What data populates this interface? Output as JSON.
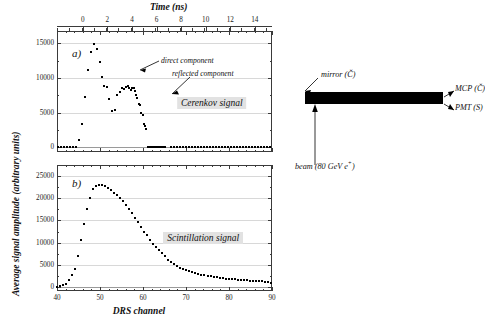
{
  "figure": {
    "y_axis_label": "Average signal amplitude (arbitrary units)",
    "x_axis_label_bottom": "DRS channel",
    "x_axis_label_top": "Time (ns)"
  },
  "panel_a": {
    "letter": "a)",
    "signal_label": "Cerenkov signal",
    "annotation_direct": "direct component",
    "annotation_reflected": "reflected component"
  },
  "panel_b": {
    "letter": "b)",
    "signal_label": "Scintillation signal"
  },
  "schematic": {
    "mirror_label": "mirror (Č)",
    "mcp_label": "MCP (Č)",
    "pmt_label": "PMT (S)",
    "beam_label": "beam (80 GeV e",
    "beam_label_sup": "+",
    "beam_label_end": ")"
  },
  "colors": {
    "axis": "#3a3a3a",
    "grid": "#d8d8d8",
    "marker": "#000000",
    "label_bg": "#e2e2e2",
    "bar": "#000000"
  },
  "chart_data": [
    {
      "type": "scatter",
      "id": "panel-a",
      "title": "Cerenkov signal",
      "xlabel": "DRS channel",
      "xlabel_top": "Time (ns)",
      "ylabel": "Average signal amplitude (arbitrary units)",
      "xlim": [
        40,
        90
      ],
      "ylim": [
        -700,
        16800
      ],
      "yticks": [
        0,
        5000,
        10000,
        15000
      ],
      "xticks": [
        40,
        50,
        60,
        70,
        80,
        90
      ],
      "xticks_top": [
        0,
        2,
        4,
        6,
        8,
        10,
        12,
        14
      ],
      "top_axis_xlim_ns": [
        -2.1,
        15.4
      ],
      "grid": true,
      "legend": "none",
      "annotations": [
        {
          "text": "direct component",
          "x": 53.5,
          "y": 12600
        },
        {
          "text": "reflected component",
          "x": 56.5,
          "y": 11100
        },
        {
          "text": "Cerenkov signal",
          "x": 76,
          "y": 6400
        }
      ],
      "x": [
        40.3,
        41.0,
        41.7,
        42.4,
        43.1,
        43.8,
        44.5,
        45.2,
        45.9,
        46.6,
        47.3,
        48.0,
        48.7,
        49.3,
        49.9,
        50.4,
        51.0,
        51.6,
        52.2,
        52.8,
        53.4,
        54.0,
        54.6,
        55.2,
        55.6,
        56.0,
        56.4,
        56.8,
        57.2,
        57.5,
        57.8,
        58.1,
        58.4,
        58.7,
        59.0,
        59.3,
        59.6,
        59.9,
        60.2,
        60.5,
        60.8,
        61.1,
        61.4,
        61.7,
        62.0,
        62.3,
        62.6,
        62.9,
        63.2,
        63.5,
        63.8,
        64.1,
        64.4,
        64.7,
        65.0,
        66.5,
        67.2,
        67.9,
        68.6,
        69.3,
        70.0,
        70.7,
        71.4,
        72.1,
        72.8,
        73.5,
        74.2,
        74.9,
        75.6,
        76.3,
        77.0,
        77.7,
        78.4,
        79.1,
        79.8,
        80.5,
        81.2,
        81.9,
        82.6,
        83.3,
        84.0,
        84.7,
        85.4,
        86.1,
        86.8,
        87.5,
        88.2,
        88.9,
        89.6
      ],
      "y": [
        0,
        0,
        0,
        0,
        0,
        0,
        0,
        1100,
        3400,
        7300,
        11100,
        13800,
        14900,
        14200,
        12300,
        10200,
        8800,
        8700,
        7000,
        5200,
        5400,
        7600,
        8000,
        8600,
        8400,
        8700,
        8900,
        8500,
        8200,
        8600,
        8500,
        8100,
        7500,
        7100,
        6200,
        6100,
        5000,
        4700,
        3300,
        3100,
        2600,
        0,
        0,
        0,
        0,
        0,
        0,
        0,
        0,
        0,
        0,
        0,
        0,
        0,
        0,
        0,
        0,
        0,
        0,
        0,
        0,
        0,
        0,
        0,
        0,
        0,
        0,
        0,
        0,
        0,
        0,
        0,
        0,
        0,
        0,
        0,
        0,
        0,
        0,
        0,
        0,
        0,
        0,
        0,
        0,
        0,
        0,
        0,
        0
      ]
    },
    {
      "type": "scatter",
      "id": "panel-b",
      "title": "Scintillation signal",
      "xlabel": "DRS channel",
      "ylabel": "Average signal amplitude (arbitrary units)",
      "xlim": [
        40,
        90
      ],
      "ylim": [
        -900,
        27500
      ],
      "yticks": [
        0,
        5000,
        10000,
        15000,
        20000,
        25000
      ],
      "xticks": [
        40,
        50,
        60,
        70,
        80,
        90
      ],
      "grid": true,
      "legend": "none",
      "annotations": [
        {
          "text": "Scintillation signal",
          "x": 74,
          "y": 11000
        }
      ],
      "x": [
        40.0,
        40.7,
        41.4,
        42.1,
        42.8,
        43.5,
        44.2,
        44.9,
        45.6,
        46.3,
        47.0,
        47.7,
        48.4,
        49.1,
        49.8,
        50.5,
        51.2,
        51.9,
        52.6,
        53.3,
        54.0,
        54.7,
        55.4,
        56.1,
        56.8,
        57.5,
        58.2,
        58.9,
        59.6,
        60.3,
        61.0,
        61.7,
        62.4,
        63.1,
        63.8,
        64.5,
        65.2,
        65.9,
        66.6,
        67.3,
        68.0,
        68.7,
        69.4,
        70.1,
        70.8,
        71.5,
        72.2,
        72.9,
        73.6,
        74.3,
        75.0,
        75.7,
        76.4,
        77.1,
        77.8,
        78.5,
        79.2,
        79.9,
        80.6,
        81.3,
        82.0,
        82.7,
        83.4,
        84.1,
        84.8,
        85.5,
        86.2,
        86.9,
        87.6,
        88.3,
        89.0,
        89.7
      ],
      "y": [
        100,
        200,
        400,
        700,
        1500,
        2600,
        4000,
        6900,
        10500,
        14300,
        17500,
        20100,
        22200,
        22800,
        23100,
        23000,
        22800,
        22300,
        21900,
        21300,
        20800,
        20000,
        19300,
        18500,
        17600,
        16700,
        15600,
        14600,
        13500,
        12500,
        11700,
        10700,
        9800,
        9100,
        8400,
        7600,
        7000,
        6200,
        5600,
        5100,
        4700,
        4300,
        4100,
        3900,
        3500,
        3400,
        3200,
        3000,
        2800,
        2700,
        2500,
        2400,
        2300,
        2200,
        2100,
        2000,
        1900,
        1800,
        1750,
        1700,
        1650,
        1600,
        1550,
        1500,
        1450,
        1400,
        1350,
        1300,
        1250,
        1200,
        1150,
        1000
      ]
    }
  ]
}
